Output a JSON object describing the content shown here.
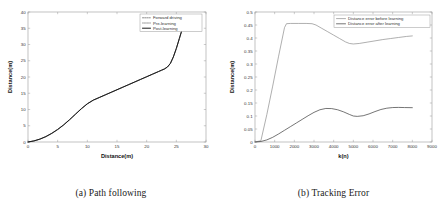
{
  "figure": {
    "panels": [
      {
        "caption": "(a) Path following",
        "xlabel": "Distance(m)",
        "ylabel": "Distance(m)"
      },
      {
        "caption": "(b) Tracking Error",
        "xlabel": "k(n)",
        "ylabel": "Distance(m)"
      }
    ]
  },
  "chart_data": [
    {
      "type": "line",
      "title": "(a) Path following",
      "xlabel": "Distance(m)",
      "ylabel": "Distance(m)",
      "xlim": [
        0,
        30
      ],
      "ylim": [
        0,
        40
      ],
      "xticks": [
        0,
        5,
        10,
        15,
        20,
        25,
        30
      ],
      "yticks": [
        0,
        5,
        10,
        15,
        20,
        25,
        30,
        35,
        40
      ],
      "grid": false,
      "legend_position": "upper right",
      "legend": [
        "Forward driving",
        "Pre-learning",
        "Post-learning"
      ],
      "series": [
        {
          "name": "Forward driving",
          "color": "#5a5a5a",
          "dash": "1.2,1.0",
          "width": 0.7,
          "x": [
            0,
            1,
            2,
            3,
            4,
            5,
            6,
            7,
            8,
            9,
            10,
            11,
            12,
            13,
            14,
            15,
            16,
            17,
            18,
            19,
            20,
            21,
            22,
            22.5,
            23,
            23.5,
            24,
            24.5,
            25,
            25.5,
            25.9
          ],
          "y": [
            0,
            0.35,
            0.9,
            1.7,
            2.7,
            3.9,
            5.3,
            6.9,
            8.6,
            10.3,
            11.8,
            12.9,
            13.7,
            14.5,
            15.3,
            16.1,
            16.9,
            17.7,
            18.5,
            19.3,
            20.1,
            20.9,
            21.7,
            22.1,
            22.5,
            23.1,
            24.2,
            26.2,
            28.8,
            31.8,
            34.2
          ]
        },
        {
          "name": "Pre-learning",
          "color": "#6e6e6e",
          "dash": "0.6,0.9",
          "width": 0.7,
          "x": [
            0,
            1,
            2,
            3,
            4,
            5,
            6,
            7,
            8,
            9,
            10,
            11,
            12,
            13,
            14,
            15,
            16,
            17,
            18,
            19,
            20,
            21,
            22,
            22.5,
            23,
            23.5,
            24,
            24.5,
            25,
            25.5,
            25.9
          ],
          "y": [
            0,
            0.3,
            0.85,
            1.6,
            2.6,
            3.8,
            5.2,
            6.8,
            8.5,
            10.2,
            11.7,
            12.85,
            13.65,
            14.45,
            15.25,
            16.05,
            16.85,
            17.65,
            18.45,
            19.25,
            20.05,
            20.85,
            21.65,
            22.05,
            22.45,
            23.05,
            24.15,
            26.15,
            28.75,
            31.75,
            34.15
          ]
        },
        {
          "name": "Post-learning",
          "color": "#1a1a1a",
          "dash": "none",
          "width": 1.0,
          "x": [
            0,
            1,
            2,
            3,
            4,
            5,
            6,
            7,
            8,
            9,
            10,
            11,
            12,
            13,
            14,
            15,
            16,
            17,
            18,
            19,
            20,
            21,
            22,
            22.5,
            23,
            23.5,
            24,
            24.5,
            25,
            25.5,
            25.9
          ],
          "y": [
            0,
            0.33,
            0.88,
            1.65,
            2.65,
            3.85,
            5.25,
            6.85,
            8.55,
            10.25,
            11.75,
            12.88,
            13.68,
            14.48,
            15.28,
            16.08,
            16.88,
            17.68,
            18.48,
            19.28,
            20.08,
            20.88,
            21.68,
            22.08,
            22.48,
            23.08,
            24.18,
            26.18,
            28.78,
            31.78,
            34.18
          ]
        }
      ]
    },
    {
      "type": "line",
      "title": "(b) Tracking Error",
      "xlabel": "k(n)",
      "ylabel": "Distance(m)",
      "xlim": [
        0,
        9000
      ],
      "ylim": [
        0,
        0.5
      ],
      "xticks": [
        0,
        1000,
        2000,
        3000,
        4000,
        5000,
        6000,
        7000,
        8000,
        9000
      ],
      "yticks": [
        0,
        0.05,
        0.1,
        0.15,
        0.2,
        0.25,
        0.3,
        0.35,
        0.4,
        0.45,
        0.5
      ],
      "grid": false,
      "legend_position": "upper right",
      "legend": [
        "Distance error before learning",
        "Distance error after learning"
      ],
      "series": [
        {
          "name": "Distance error before learning",
          "color": "#8c8c8c",
          "dash": "none",
          "width": 0.7,
          "x": [
            0,
            300,
            600,
            900,
            1200,
            1500,
            1600,
            1800,
            2200,
            2600,
            2900,
            3100,
            3400,
            3700,
            4000,
            4300,
            4600,
            4800,
            5000,
            5300,
            5700,
            6100,
            6500,
            6900,
            7300,
            7700,
            8000
          ],
          "y": [
            0,
            0.005,
            0.105,
            0.215,
            0.33,
            0.44,
            0.455,
            0.456,
            0.456,
            0.456,
            0.455,
            0.45,
            0.437,
            0.424,
            0.411,
            0.398,
            0.385,
            0.379,
            0.377,
            0.379,
            0.384,
            0.389,
            0.394,
            0.398,
            0.402,
            0.406,
            0.408
          ]
        },
        {
          "name": "Distance error after learning",
          "color": "#3a3a3a",
          "dash": "none",
          "width": 0.7,
          "x": [
            0,
            300,
            600,
            900,
            1200,
            1500,
            1800,
            2100,
            2400,
            2700,
            3000,
            3300,
            3600,
            3900,
            4200,
            4500,
            4800,
            5000,
            5200,
            5500,
            5800,
            6100,
            6400,
            6700,
            7000,
            7300,
            7600,
            8000
          ],
          "y": [
            0,
            0.002,
            0.008,
            0.018,
            0.031,
            0.045,
            0.059,
            0.073,
            0.087,
            0.101,
            0.114,
            0.124,
            0.129,
            0.1285,
            0.124,
            0.116,
            0.106,
            0.1,
            0.0985,
            0.101,
            0.108,
            0.117,
            0.125,
            0.13,
            0.1325,
            0.133,
            0.1325,
            0.132
          ]
        }
      ]
    }
  ]
}
